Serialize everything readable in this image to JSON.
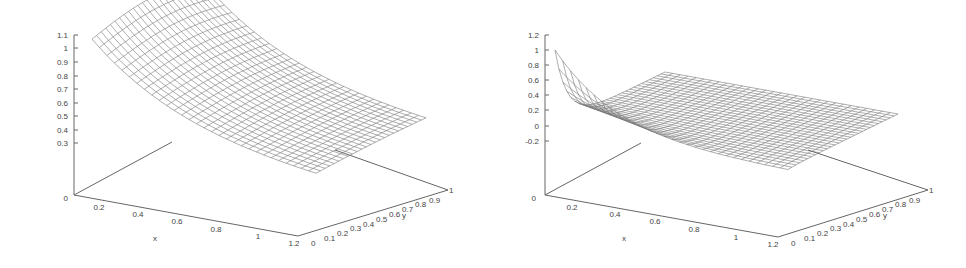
{
  "chart_data": [
    {
      "type": "surface3d",
      "title": "",
      "xlabel": "x",
      "ylabel": "y",
      "zlabel": "",
      "x_ticks": [
        "0.2",
        "0.4",
        "0.6",
        "0.8",
        "1",
        "1.2"
      ],
      "y_ticks": [
        "0",
        "0.1",
        "0.2",
        "0.3",
        "0.4",
        "0.5",
        "0.6",
        "0.7",
        "0.8",
        "0.9",
        "1"
      ],
      "z_ticks": [
        "0.3",
        "0.4",
        "0.5",
        "0.6",
        "0.7",
        "0.8",
        "0.9",
        "1",
        "1.1"
      ],
      "origin_label": "0",
      "xlim": [
        0,
        1.2
      ],
      "ylim": [
        0,
        1
      ],
      "zlim": [
        0.3,
        1.1
      ],
      "description": "Wireframe surface decaying smoothly from ~1.0 near x=0 toward ~0.3 at x=1.2; slight hump along y near x=0"
    },
    {
      "type": "surface3d",
      "title": "",
      "xlabel": "x",
      "ylabel": "y",
      "zlabel": "",
      "x_ticks": [
        "0.2",
        "0.4",
        "0.6",
        "0.8",
        "1",
        "1.2"
      ],
      "y_ticks": [
        "0",
        "0.1",
        "0.2",
        "0.3",
        "0.4",
        "0.5",
        "0.6",
        "0.7",
        "0.8",
        "0.9",
        "1"
      ],
      "z_ticks": [
        "-0.2",
        "0",
        "0.2",
        "0.4",
        "0.6",
        "0.8",
        "1",
        "1.2"
      ],
      "origin_label": "0",
      "xlim": [
        0,
        1.2
      ],
      "ylim": [
        0,
        1
      ],
      "zlim": [
        -0.2,
        1.2
      ],
      "description": "Wireframe surface with sharp boundary-layer peak of 1 at x=0,y=0 decaying rapidly to a flat plane near z=0"
    }
  ],
  "plots": [
    {
      "xlabel": "x",
      "ylabel": "y",
      "origin": "0",
      "z_ticks": [
        "1.1",
        "1",
        "0.9",
        "0.8",
        "0.7",
        "0.6",
        "0.5",
        "0.4",
        "0.3"
      ],
      "x_ticks": [
        "0.2",
        "0.4",
        "0.6",
        "0.8",
        "1",
        "1.2"
      ],
      "y_ticks": [
        "0",
        "0.1",
        "0.2",
        "0.3",
        "0.4",
        "0.5",
        "0.6",
        "0.7",
        "0.8",
        "0.9",
        "1"
      ]
    },
    {
      "xlabel": "x",
      "ylabel": "y",
      "origin": "0",
      "z_ticks": [
        "1.2",
        "1",
        "0.8",
        "0.6",
        "0.4",
        "0.2",
        "0",
        "-0.2"
      ],
      "x_ticks": [
        "0.2",
        "0.4",
        "0.6",
        "0.8",
        "1",
        "1.2"
      ],
      "y_ticks": [
        "0",
        "0.1",
        "0.2",
        "0.3",
        "0.4",
        "0.5",
        "0.6",
        "0.7",
        "0.8",
        "0.9",
        "1"
      ]
    }
  ]
}
